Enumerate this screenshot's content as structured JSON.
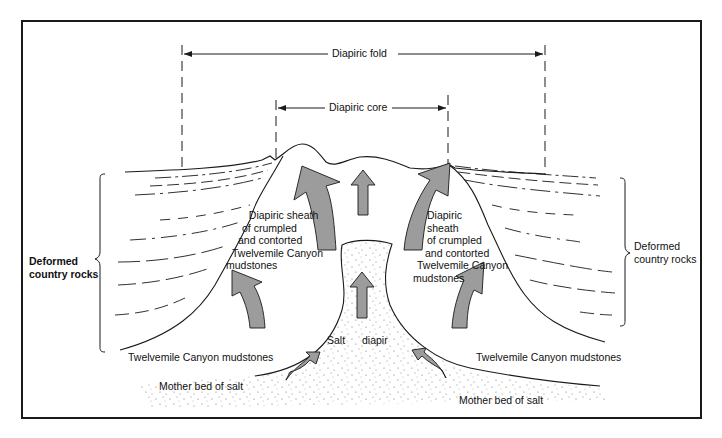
{
  "figure": {
    "dimension_labels": {
      "fold": "Diapiric fold",
      "core": "Diapiric core"
    },
    "left": {
      "country_rocks": [
        "Deformed",
        "country rocks"
      ],
      "sheath": [
        "Diapiric sheath",
        "of crumpled",
        "and contorted",
        "Twelvemile Canyon",
        "mudstones"
      ],
      "mudstones": "Twelvemile Canyon mudstones",
      "mother_bed": "Mother bed of salt"
    },
    "right": {
      "country_rocks": [
        "Deformed",
        "country rocks"
      ],
      "sheath": [
        "Diapiric",
        "sheath",
        "of crumpled",
        "and contorted",
        "Twelvemile Canyon",
        "mudstones"
      ],
      "mudstones": "Twelvemile Canyon mudstones",
      "mother_bed": "Mother bed of salt"
    },
    "center": {
      "salt": "Salt",
      "diapir": "diapir"
    },
    "colors": {
      "line": "#1a1a1a",
      "arrow_fill": "#9c9c9c",
      "background": "#ffffff",
      "stipple": "#6a6a6a"
    }
  }
}
